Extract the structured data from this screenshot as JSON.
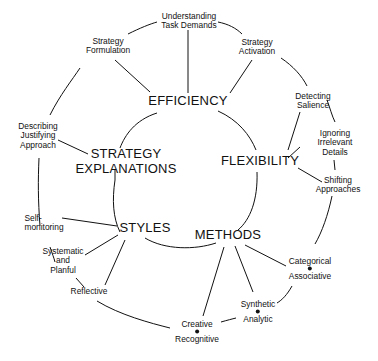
{
  "diagram": {
    "core_concepts": [
      {
        "id": "efficiency",
        "label": "EFFICIENCY"
      },
      {
        "id": "flexibility",
        "label": "FLEXIBILITY"
      },
      {
        "id": "methods",
        "label": "METHODS"
      },
      {
        "id": "styles",
        "label": "STYLES"
      },
      {
        "id": "strategy_explanations",
        "line1": "STRATEGY",
        "line2": "EXPLANATIONS"
      }
    ],
    "nodes": {
      "understanding": {
        "line1": "Understanding",
        "line2": "Task Demands"
      },
      "formulation": {
        "line1": "Strategy",
        "line2": "Formulation"
      },
      "activation": {
        "line1": "Strategy",
        "line2": "Activation"
      },
      "salience": {
        "line1": "Detecting",
        "line2": "Salience"
      },
      "ignoring": {
        "line1": "Ignoring",
        "line2": "Irrelevant",
        "line3": "Details"
      },
      "shifting": {
        "line1": "Shifting",
        "line2": "Approaches"
      },
      "categorical": {
        "line1": "Categorical",
        "line2": "Associative"
      },
      "synthetic": {
        "line1": "Synthetic",
        "line2": "Analytic"
      },
      "creative": {
        "line1": "Creative",
        "line2": "Recognitive"
      },
      "reflective": {
        "line1": "Reflective"
      },
      "systematic": {
        "line1": "Systematic",
        "line2": "and",
        "line3": "Planful"
      },
      "selfmon": {
        "line1": "Self-",
        "line2": "monitoring"
      },
      "describing": {
        "line1": "Describing",
        "line2": "Justifying",
        "line3": "Approach"
      }
    },
    "edges": [
      [
        "EFFICIENCY",
        "Understanding Task Demands"
      ],
      [
        "EFFICIENCY",
        "Strategy Formulation"
      ],
      [
        "EFFICIENCY",
        "Strategy Activation"
      ],
      [
        "FLEXIBILITY",
        "Detecting Salience"
      ],
      [
        "FLEXIBILITY",
        "Ignoring Irrelevant Details"
      ],
      [
        "FLEXIBILITY",
        "Shifting Approaches"
      ],
      [
        "METHODS",
        "Categorical / Associative"
      ],
      [
        "METHODS",
        "Synthetic / Analytic"
      ],
      [
        "METHODS",
        "Creative / Recognitive"
      ],
      [
        "STYLES",
        "Self-monitoring"
      ],
      [
        "STYLES",
        "Systematic and Planful"
      ],
      [
        "STYLES",
        "Reflective"
      ],
      [
        "STRATEGY EXPLANATIONS",
        "Describing Justifying Approach"
      ]
    ]
  }
}
